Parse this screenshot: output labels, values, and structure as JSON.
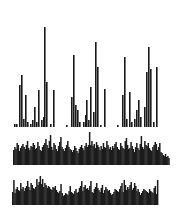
{
  "chart_data": [
    {
      "type": "bar",
      "title": "",
      "xlabel": "",
      "ylabel": "",
      "grid": false,
      "legend": null,
      "panel": "top-sparse-histogram",
      "baseline_y": 127,
      "bar_width": 1.6,
      "color": "#1a1a1a",
      "x": [
        14,
        16,
        19,
        21,
        23,
        25,
        27,
        30,
        32,
        34,
        36,
        38,
        41,
        43,
        44,
        46,
        50,
        53,
        66,
        71,
        73,
        75,
        77,
        79,
        83,
        85,
        86,
        88,
        90,
        93,
        95,
        97,
        100,
        104,
        117,
        122,
        124,
        126,
        129,
        131,
        134,
        136,
        138,
        140,
        144,
        146,
        148,
        150,
        153,
        156
      ],
      "values": [
        3,
        3,
        42,
        52,
        8,
        32,
        5,
        3,
        7,
        20,
        5,
        37,
        7,
        10,
        100,
        45,
        3,
        37,
        2,
        30,
        72,
        22,
        17,
        5,
        5,
        12,
        27,
        7,
        40,
        15,
        85,
        60,
        2,
        38,
        2,
        32,
        70,
        8,
        35,
        5,
        8,
        17,
        27,
        10,
        20,
        55,
        80,
        58,
        5,
        60
      ]
    },
    {
      "type": "bar",
      "title": "",
      "xlabel": "",
      "ylabel": "",
      "grid": false,
      "legend": null,
      "panel": "middle-dense-waveform",
      "baseline_y": 165,
      "x_start": 13,
      "bar_width": 1.5,
      "color": "#1c1c1c",
      "values": [
        15,
        18,
        16,
        22,
        20,
        14,
        17,
        19,
        21,
        18,
        16,
        20,
        24,
        17,
        15,
        19,
        18,
        22,
        20,
        16,
        17,
        23,
        19,
        15,
        14,
        18,
        20,
        22,
        26,
        20,
        17,
        24,
        30,
        18,
        15,
        22,
        20,
        16,
        14,
        19,
        23,
        28,
        18,
        16,
        14,
        17,
        20,
        24,
        18,
        16,
        15,
        13,
        15,
        19,
        17,
        14,
        12,
        16,
        18,
        20,
        17,
        15,
        19,
        22,
        18,
        20,
        33,
        20,
        24,
        19,
        21,
        17,
        23,
        20,
        18,
        15,
        19,
        16,
        22,
        18,
        17,
        24,
        20,
        16,
        18,
        15,
        19,
        17,
        21,
        23,
        18,
        16,
        15,
        22,
        19,
        17,
        16,
        24,
        27,
        20,
        16,
        17,
        23,
        19,
        16,
        13,
        18,
        22,
        17,
        15,
        21,
        29,
        18,
        16,
        24,
        20,
        19,
        22,
        17,
        15,
        14,
        18,
        20,
        23,
        21,
        15,
        18,
        22,
        13,
        12,
        10,
        9,
        11,
        8,
        9,
        7
      ],
      "ylim": [
        0,
        34
      ]
    },
    {
      "type": "bar",
      "title": "",
      "xlabel": "",
      "ylabel": "",
      "grid": false,
      "legend": null,
      "panel": "bottom-dense-waveform",
      "baseline_y": 205,
      "x_start": 12,
      "bar_width": 1.5,
      "color": "#1c1c1c",
      "values": [
        13,
        25,
        12,
        16,
        18,
        15,
        14,
        22,
        16,
        18,
        14,
        17,
        19,
        24,
        18,
        15,
        22,
        20,
        17,
        16,
        18,
        26,
        20,
        23,
        29,
        21,
        26,
        18,
        22,
        20,
        17,
        19,
        18,
        16,
        15,
        18,
        17,
        19,
        15,
        13,
        12,
        14,
        21,
        12,
        9,
        10,
        12,
        11,
        10,
        14,
        19,
        13,
        12,
        11,
        14,
        16,
        12,
        13,
        17,
        19,
        24,
        14,
        18,
        20,
        16,
        17,
        15,
        19,
        24,
        13,
        12,
        16,
        18,
        22,
        17,
        15,
        13,
        17,
        20,
        12,
        15,
        18,
        16,
        14,
        15,
        12,
        10,
        11,
        13,
        16,
        15,
        14,
        13,
        16,
        19,
        22,
        13,
        25,
        20,
        15,
        18,
        16,
        20,
        23,
        15,
        17,
        22,
        19,
        14,
        16,
        13,
        10,
        12,
        14,
        16,
        15,
        14,
        13,
        12,
        16,
        14,
        13,
        12,
        17,
        19,
        11,
        25
      ]
    }
  ]
}
